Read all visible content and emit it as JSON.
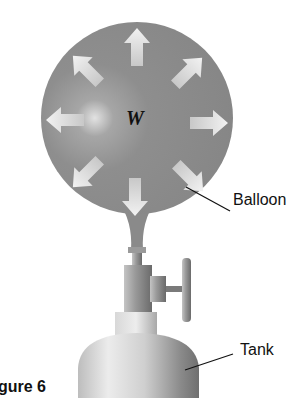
{
  "figure": {
    "caption": "gure 6",
    "symbol_label": "W",
    "labels": {
      "balloon": "Balloon",
      "tank": "Tank"
    },
    "arrows": [
      {
        "direction": "up"
      },
      {
        "direction": "up-right"
      },
      {
        "direction": "right"
      },
      {
        "direction": "down-right"
      },
      {
        "direction": "down"
      },
      {
        "direction": "down-left"
      },
      {
        "direction": "left"
      },
      {
        "direction": "up-left"
      }
    ],
    "colors": {
      "balloon": "#8c8c8c",
      "arrow": "#e6e6e6",
      "tank": "#d4d4d4",
      "text": "#111111"
    }
  }
}
